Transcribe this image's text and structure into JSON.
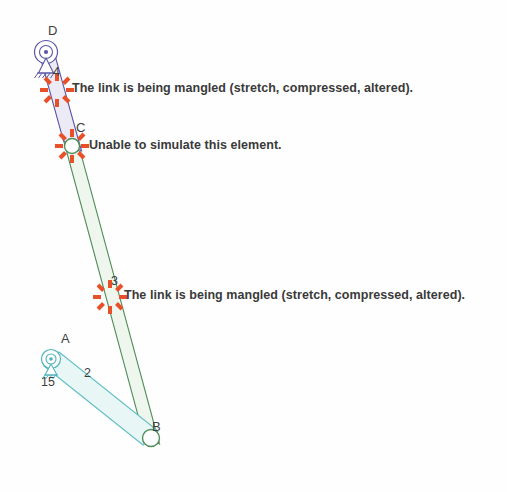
{
  "canvas": {
    "width": 507,
    "height": 492,
    "background": "#ffffff"
  },
  "palette": {
    "link2_stroke": "#5fbfc4",
    "link2_fill": "#e8f6f6",
    "link3_stroke": "#4f8f5a",
    "link3_fill": "#eef6ee",
    "link4_stroke": "#5a56a8",
    "link4_fill": "#eceaf5",
    "joint_ground_d": "#5a56a8",
    "joint_ground_a": "#4fb3bd",
    "joint_pin_b": "#4f8f5a",
    "joint_pin_c": "#4f8f5a",
    "error_burst": "#e8502a",
    "text": "#3a3a3a"
  },
  "joints": [
    {
      "id": "D",
      "label": "D",
      "x": 46,
      "y": 52,
      "type": "grounded-pin",
      "label_x": 48,
      "label_y": 32,
      "color": "#5a56a8"
    },
    {
      "id": "C",
      "label": "C",
      "x": 72,
      "y": 146,
      "type": "pin",
      "label_x": 76,
      "label_y": 128,
      "color": "#4f8f5a"
    },
    {
      "id": "A",
      "label": "A",
      "x": 51,
      "y": 359,
      "type": "grounded-pin",
      "label_x": 61,
      "label_y": 340,
      "color": "#4fb3bd"
    },
    {
      "id": "B",
      "label": "B",
      "x": 151,
      "y": 438,
      "type": "pin",
      "label_x": 152,
      "label_y": 427,
      "color": "#4f8f5a"
    }
  ],
  "links": [
    {
      "id": "link-2",
      "label": "2",
      "from": "A",
      "to": "B",
      "label_x": 85,
      "label_y": 372,
      "stroke": "#5fbfc4",
      "fill": "#e8f6f6"
    },
    {
      "id": "link-3",
      "label": "3",
      "from": "C",
      "to": "B",
      "label_x": 112,
      "label_y": 280,
      "stroke": "#4f8f5a",
      "fill": "#eef6ee"
    },
    {
      "id": "link-4",
      "label": "4",
      "from": "D",
      "to": "C",
      "label_x": 54,
      "label_y": 73,
      "stroke": "#5a56a8",
      "fill": "#eceaf5"
    }
  ],
  "dimensions": [
    {
      "id": "angle-15",
      "value": "15",
      "x": 42,
      "y": 375
    }
  ],
  "errors": [
    {
      "id": "error-link-4",
      "message": "The link is being mangled (stretch, compressed, altered).",
      "burst_x": 57,
      "burst_y": 90,
      "burst_r": 17,
      "text_x": 72,
      "text_y": 82,
      "severity": "mangled"
    },
    {
      "id": "error-joint-c",
      "message": "Unable to simulate this element.",
      "burst_x": 72,
      "burst_y": 146,
      "burst_r": 17,
      "text_x": 89,
      "text_y": 139,
      "severity": "unsimulatable"
    },
    {
      "id": "error-link-3",
      "message": "The link is being mangled (stretch, compressed, altered).",
      "burst_x": 110,
      "burst_y": 297,
      "burst_r": 17,
      "text_x": 124,
      "text_y": 289,
      "severity": "mangled"
    }
  ]
}
